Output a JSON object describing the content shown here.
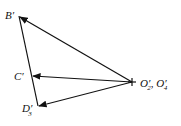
{
  "diagram": {
    "type": "velocity-polygon",
    "stroke_color": "#111111",
    "background": "#ffffff",
    "nodes": [
      {
        "id": "B",
        "label": "B",
        "prime": "′",
        "subscript": ""
      },
      {
        "id": "C",
        "label": "C",
        "prime": "′",
        "subscript": ""
      },
      {
        "id": "D3",
        "label": "D",
        "prime": "′",
        "subscript": "3"
      },
      {
        "id": "O",
        "label": "O",
        "prime": "′",
        "subscript": "2",
        "label2": "O",
        "prime2": "′",
        "subscript2": "4",
        "separator": ", "
      }
    ],
    "edges": [
      {
        "from": "O",
        "to": "B",
        "arrow": true
      },
      {
        "from": "O",
        "to": "C",
        "arrow": true
      },
      {
        "from": "O",
        "to": "D3",
        "arrow": true
      },
      {
        "from": "B",
        "to": "D3",
        "arrow": false
      }
    ]
  }
}
